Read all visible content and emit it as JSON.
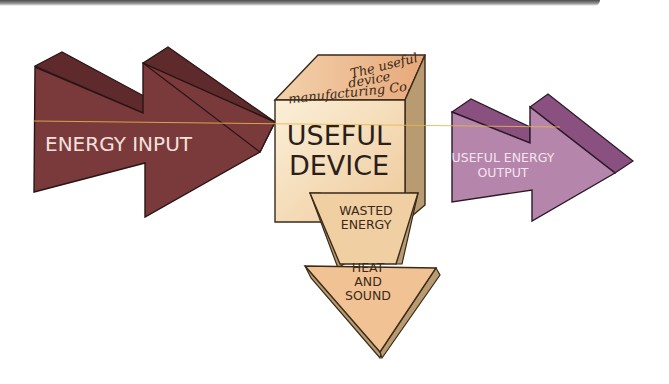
{
  "diagram": {
    "input_arrow": {
      "label": "ENERGY INPUT",
      "color": "#7a3a3c",
      "shade": "#5e2a2c"
    },
    "device": {
      "label_line1": "USEFUL",
      "label_line2": "DEVICE",
      "top_text_line1": "The useful",
      "top_text_line2": "device",
      "top_text_line3": "manufacturing Co.",
      "front_color": "#f2dcb4",
      "top_color": "#eebf95",
      "side_color": "#b89b70"
    },
    "output_arrow": {
      "label_line1": "USEFUL ENERGY",
      "label_line2": "OUTPUT",
      "color": "#b585ab",
      "shade": "#8a5080"
    },
    "waste_arrow": {
      "label_line1": "WASTED",
      "label_line2": "ENERGY",
      "head_line1": "HEAT",
      "head_line2": "AND",
      "head_line3": "SOUND",
      "color": "#f0c294",
      "shade": "#b89b70"
    },
    "guide_line_color": "#e8b84a"
  }
}
